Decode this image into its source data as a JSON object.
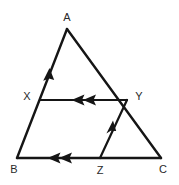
{
  "figure": {
    "name": "triangle-with-midsegments",
    "canvas": {
      "width": 179,
      "height": 185
    },
    "stroke_color": "#151515",
    "label_color": "#2a2a2a",
    "background_color": "#ffffff",
    "labels": {
      "apex": "A",
      "bottom_left": "B",
      "bottom_right": "C",
      "left_mid": "X",
      "right_mid": "Y",
      "base_mid": "Z"
    },
    "points": {
      "A": {
        "x": 67,
        "y": 29
      },
      "B": {
        "x": 17,
        "y": 158
      },
      "C": {
        "x": 161,
        "y": 158
      },
      "X": {
        "x": 40,
        "y": 100
      },
      "Y": {
        "x": 127,
        "y": 100
      },
      "Z": {
        "x": 100,
        "y": 158
      }
    },
    "label_positions": {
      "A": {
        "x": 67,
        "y": 18
      },
      "B": {
        "x": 14,
        "y": 170
      },
      "C": {
        "x": 163,
        "y": 170
      },
      "X": {
        "x": 27,
        "y": 97
      },
      "Y": {
        "x": 139,
        "y": 97
      },
      "Z": {
        "x": 100,
        "y": 171
      }
    },
    "segments": [
      {
        "name": "side-AB",
        "from": "A",
        "to": "B"
      },
      {
        "name": "side-AC",
        "from": "A",
        "to": "C"
      },
      {
        "name": "side-BC",
        "from": "B",
        "to": "C"
      },
      {
        "name": "segment-XY",
        "from": "X",
        "to": "Y"
      },
      {
        "name": "segment-ZY",
        "from": "Z",
        "to": "Y"
      }
    ],
    "arrow_marks": [
      {
        "name": "arrow-BA-single",
        "on": "side-AB",
        "count": 1,
        "direction": "up-toward-A",
        "at": {
          "x": 48,
          "y": 72
        }
      },
      {
        "name": "arrow-XY-double",
        "on": "segment-XY",
        "count": 2,
        "direction": "left-toward-X",
        "at": {
          "x": 83,
          "y": 100
        }
      },
      {
        "name": "arrow-ZY-single",
        "on": "segment-ZY",
        "count": 1,
        "direction": "up-toward-Y",
        "at": {
          "x": 110,
          "y": 128
        }
      },
      {
        "name": "arrow-BZ-double",
        "on": "side-BC",
        "count": 2,
        "direction": "left-toward-B",
        "at": {
          "x": 60,
          "y": 158
        }
      }
    ]
  }
}
